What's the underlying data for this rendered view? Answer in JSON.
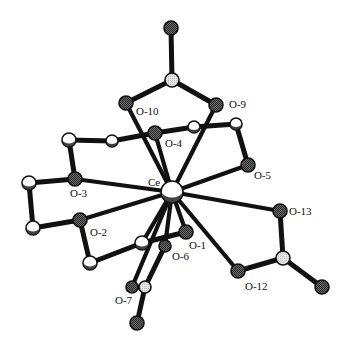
{
  "diagram": {
    "colors": {
      "bond": "#111111",
      "oxygen_fill": "#555555",
      "carbon_fill": "#ffffff",
      "nitrogen_fill": "#dddddd",
      "metal_fill": "#ffffff",
      "outline": "#111111",
      "label": "#111111"
    },
    "metal": {
      "id": "Ce",
      "label": "Ce",
      "x": 172,
      "y": 192,
      "r": 11,
      "label_x": 148,
      "label_y": 186
    },
    "atoms": [
      {
        "id": "M1",
        "type": "oxygen",
        "x": 171,
        "y": 28,
        "r": 7
      },
      {
        "id": "N1",
        "type": "nitrogen",
        "x": 172,
        "y": 80,
        "r": 7
      },
      {
        "id": "O10",
        "type": "oxygen",
        "label": "O-10",
        "x": 126,
        "y": 103,
        "r": 7,
        "lx": 136,
        "ly": 115
      },
      {
        "id": "O9",
        "type": "oxygen",
        "label": "O-9",
        "x": 216,
        "y": 105,
        "r": 7,
        "lx": 229,
        "ly": 108
      },
      {
        "id": "O4",
        "type": "oxygen",
        "label": "O-4",
        "x": 155,
        "y": 133,
        "r": 7,
        "lx": 165,
        "ly": 147
      },
      {
        "id": "C1",
        "type": "carbon",
        "x": 112,
        "y": 141,
        "r": 6
      },
      {
        "id": "C2",
        "type": "carbon",
        "x": 194,
        "y": 127,
        "r": 6
      },
      {
        "id": "C3",
        "type": "carbon",
        "x": 236,
        "y": 124,
        "r": 6
      },
      {
        "id": "O5",
        "type": "oxygen",
        "label": "O-5",
        "x": 248,
        "y": 165,
        "r": 7,
        "lx": 254,
        "ly": 179
      },
      {
        "id": "C4",
        "type": "carbon",
        "x": 69,
        "y": 140,
        "r": 7
      },
      {
        "id": "O3",
        "type": "oxygen",
        "label": "O-3",
        "x": 75,
        "y": 179,
        "r": 7,
        "lx": 70,
        "ly": 197
      },
      {
        "id": "C5",
        "type": "carbon",
        "x": 29,
        "y": 183,
        "r": 7
      },
      {
        "id": "C6",
        "type": "carbon",
        "x": 33,
        "y": 228,
        "r": 7
      },
      {
        "id": "O2",
        "type": "oxygen",
        "label": "O-2",
        "x": 80,
        "y": 220,
        "r": 7,
        "lx": 90,
        "ly": 236
      },
      {
        "id": "C7",
        "type": "carbon",
        "x": 90,
        "y": 263,
        "r": 7
      },
      {
        "id": "C8",
        "type": "carbon",
        "x": 142,
        "y": 243,
        "r": 7
      },
      {
        "id": "O6",
        "type": "oxygen",
        "label": "O-6",
        "x": 165,
        "y": 246,
        "r": 6,
        "lx": 172,
        "ly": 260
      },
      {
        "id": "O1",
        "type": "oxygen",
        "label": "O-1",
        "x": 186,
        "y": 232,
        "r": 7,
        "lx": 189,
        "ly": 249
      },
      {
        "id": "O7",
        "type": "oxygen",
        "label": "O-7",
        "x": 132,
        "y": 287,
        "r": 6,
        "lx": 115,
        "ly": 304
      },
      {
        "id": "N3",
        "type": "nitrogen",
        "x": 145,
        "y": 287,
        "r": 6
      },
      {
        "id": "M3",
        "type": "oxygen",
        "x": 137,
        "y": 323,
        "r": 7
      },
      {
        "id": "O13",
        "type": "oxygen",
        "label": "O-13",
        "x": 280,
        "y": 211,
        "r": 7,
        "lx": 289,
        "ly": 215
      },
      {
        "id": "N2",
        "type": "nitrogen",
        "x": 283,
        "y": 258,
        "r": 7
      },
      {
        "id": "O12",
        "type": "oxygen",
        "label": "O-12",
        "x": 238,
        "y": 271,
        "r": 7,
        "lx": 245,
        "ly": 290
      },
      {
        "id": "M2",
        "type": "oxygen",
        "x": 322,
        "y": 287,
        "r": 7
      }
    ],
    "bonds": [
      [
        "M1",
        "N1"
      ],
      [
        "N1",
        "O10"
      ],
      [
        "N1",
        "O9"
      ],
      [
        "C1",
        "O4"
      ],
      [
        "O4",
        "C2"
      ],
      [
        "C2",
        "C3"
      ],
      [
        "C3",
        "O5"
      ],
      [
        "C1",
        "C4"
      ],
      [
        "C4",
        "O3"
      ],
      [
        "O3",
        "C5"
      ],
      [
        "C5",
        "C6"
      ],
      [
        "C6",
        "O2"
      ],
      [
        "O2",
        "C7"
      ],
      [
        "C7",
        "C8"
      ],
      [
        "C8",
        "O1"
      ],
      [
        "O13",
        "N2"
      ],
      [
        "N2",
        "O12"
      ],
      [
        "N2",
        "M2"
      ],
      [
        "O7",
        "N3"
      ],
      [
        "N3",
        "M3"
      ],
      [
        "N3",
        "O6"
      ]
    ],
    "coordination_bonds": [
      "O10",
      "O9",
      "O4",
      "O5",
      "O3",
      "O2",
      "O13",
      "O12",
      "O1",
      "O6",
      "O7",
      "C8"
    ]
  }
}
